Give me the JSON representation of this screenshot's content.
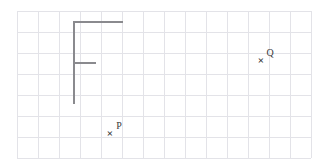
{
  "canvas": {
    "width": 329,
    "height": 165,
    "background_color": "#ffffff"
  },
  "grid": {
    "name": "square-grid",
    "origin_x": 17,
    "origin_y": 11,
    "cell_size": 21,
    "columns": 14,
    "rows": 7,
    "line_color": "#e3e3e8",
    "line_width": 1
  },
  "shape": {
    "name": "f-shape-polyline",
    "stroke_color": "#8a8a8e",
    "stroke_width": 2,
    "description": "F shape drawn on grid",
    "segments": [
      {
        "name": "top-horizontal-bar",
        "x1": 74,
        "y1": 22,
        "x2": 122,
        "y2": 22
      },
      {
        "name": "vertical-stem",
        "x1": 74,
        "y1": 22,
        "x2": 74,
        "y2": 103
      },
      {
        "name": "middle-horizontal-bar",
        "x1": 74,
        "y1": 63,
        "x2": 95,
        "y2": 63
      }
    ]
  },
  "points": [
    {
      "name": "point-p",
      "label": "P",
      "marker": "×",
      "marker_x": 110,
      "marker_y": 133,
      "label_x": 119,
      "label_y": 126
    },
    {
      "name": "point-q",
      "label": "Q",
      "marker": "×",
      "marker_x": 261,
      "marker_y": 60,
      "label_x": 270,
      "label_y": 53
    }
  ]
}
